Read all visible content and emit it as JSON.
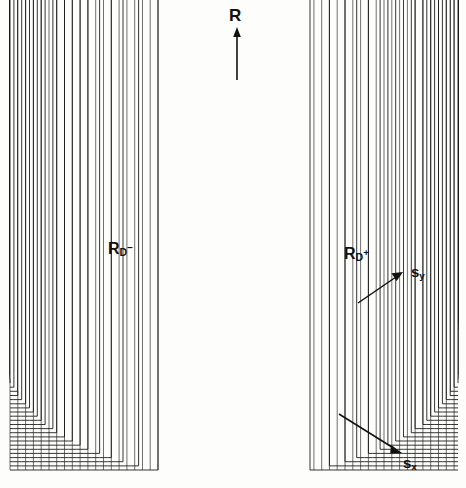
{
  "figure": {
    "type": "3d-wireframe-surface",
    "background_color": "#fdfdfb",
    "line_color": "#111111"
  },
  "labels": {
    "vertical_axis": "R",
    "satellite_left_base": "R",
    "satellite_left_sub": "D",
    "satellite_left_sup": "−",
    "satellite_right_base": "R",
    "satellite_right_sub": "D",
    "satellite_right_sup": "+",
    "axis_y_base": "s",
    "axis_y_sub": "y",
    "axis_x_base": "s",
    "axis_x_sub": "x"
  },
  "chart_data": {
    "type": "surface",
    "title": "",
    "xlabel": "sx",
    "ylabel": "sy",
    "zlabel": "R",
    "grid": false,
    "legend": "none",
    "projection": "isometric-wireframe",
    "annotations": [
      {
        "text": "R",
        "role": "vertical-axis-arrow",
        "x_px": 237,
        "y_px": 18
      },
      {
        "text": "R_D-",
        "role": "left-satellite-peak",
        "x_px": 122,
        "y_px": 250
      },
      {
        "text": "R_D+",
        "role": "right-satellite-peak",
        "x_px": 359,
        "y_px": 256
      },
      {
        "text": "s_y",
        "role": "axis-arrow",
        "x_px": 418,
        "y_px": 272
      },
      {
        "text": "s_x",
        "role": "axis-arrow",
        "x_px": 410,
        "y_px": 462
      }
    ],
    "peaks": [
      {
        "name": "R",
        "u": 0.5,
        "v": 0.5,
        "amplitude": 1.0,
        "width": 0.012
      },
      {
        "name": "R_D-",
        "u": 0.24,
        "v": 0.5,
        "amplitude": 0.255,
        "width": 0.011
      },
      {
        "name": "R_D+",
        "u": 0.76,
        "v": 0.5,
        "amplitude": 0.25,
        "width": 0.011
      }
    ],
    "noise_floor": {
      "mean_amplitude": 0.085,
      "envelope": "radial-taper",
      "grid_u": 116,
      "grid_v": 58
    },
    "axis_ranges": {
      "u": [
        0,
        1
      ],
      "v": [
        0,
        1
      ],
      "R": [
        0,
        1
      ]
    }
  }
}
